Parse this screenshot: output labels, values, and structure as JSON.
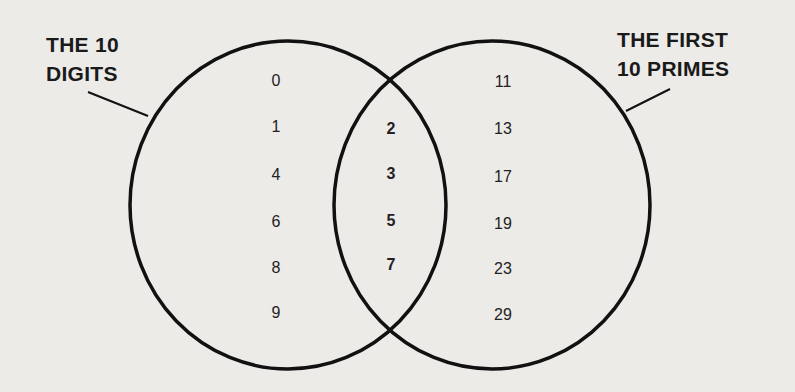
{
  "diagram": {
    "type": "venn",
    "sets": [
      {
        "label_line1": "THE 10",
        "label_line2": "DIGITS",
        "only": [
          "0",
          "1",
          "4",
          "6",
          "8",
          "9"
        ]
      },
      {
        "label_line1": "THE FIRST",
        "label_line2": "10 PRIMES",
        "only": [
          "11",
          "13",
          "17",
          "19",
          "23",
          "29"
        ]
      }
    ],
    "intersection": [
      "2",
      "3",
      "5",
      "7"
    ]
  }
}
